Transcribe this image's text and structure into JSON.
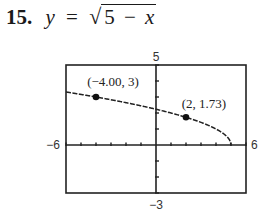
{
  "problem": {
    "number": "15.",
    "lhs": "y",
    "equals": "=",
    "radical_symbol": "√",
    "radicand_const": "5",
    "radicand_op": "−",
    "radicand_var": "x"
  },
  "window": {
    "xmin_label": "−6",
    "xmax_label": "6",
    "ymax_label": "5",
    "ymin_label": "−3"
  },
  "points": [
    {
      "label": "(−4.00, 3)"
    },
    {
      "label": "(2, 1.73)"
    }
  ],
  "colors": {
    "ink": "#1a1a1a",
    "frame": "#222222",
    "background": "#ffffff"
  },
  "chart_data": {
    "type": "line",
    "function": "sqrt(5 - x)",
    "xlabel": "",
    "ylabel": "",
    "xlim": [
      -6,
      6
    ],
    "ylim": [
      -3,
      5
    ],
    "xscale_tick": 1,
    "yscale_tick": 1,
    "grid": false,
    "series": [
      {
        "name": "y = sqrt(5 - x)",
        "x": [
          -6,
          -5,
          -4,
          -3,
          -2,
          -1,
          0,
          1,
          2,
          3,
          4,
          4.5,
          5
        ],
        "y": [
          3.32,
          3.16,
          3.0,
          2.83,
          2.65,
          2.45,
          2.24,
          2.0,
          1.73,
          1.41,
          1.0,
          0.71,
          0
        ]
      }
    ],
    "highlighted_points": [
      {
        "x": -4.0,
        "y": 3,
        "label": "(−4.00, 3)"
      },
      {
        "x": 2,
        "y": 1.73,
        "label": "(2, 1.73)"
      }
    ],
    "annotations": [
      "(−4.00, 3)",
      "(2, 1.73)"
    ],
    "axis_window_labels": {
      "left": "−6",
      "right": "6",
      "top": "5",
      "bottom": "−3"
    }
  }
}
